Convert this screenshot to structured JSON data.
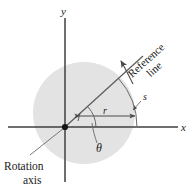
{
  "figure": {
    "axes": {
      "x_label": "x",
      "y_label": "y"
    },
    "labels": {
      "radius": "r",
      "arc_length": "s",
      "angle": "θ",
      "reference_line_word1": "Reference",
      "reference_line_word2": "line",
      "rotation_axis_word1": "Rotation",
      "rotation_axis_word2": "axis"
    },
    "icons": {
      "origin_dot": "origin-dot-icon",
      "rotation_arrow": "curved-rotation-arrow-icon",
      "radius_arrow": "double-headed-arrow-icon",
      "theta_arc": "angle-arc-icon"
    },
    "colors": {
      "background": "#ffffff",
      "disk_fill": "#e2e2e2",
      "axis_stroke": "#3a3a3a",
      "line_stroke": "#555555",
      "text": "#1a1a1a"
    },
    "geometry": {
      "origin_x": 65,
      "origin_y": 127,
      "disk_center_x": 84,
      "disk_center_y": 113,
      "disk_radius": 51,
      "reference_line_angle_deg": 42,
      "arc_radius": 72
    }
  }
}
